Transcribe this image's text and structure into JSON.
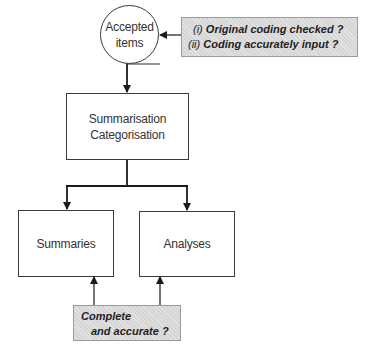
{
  "diagram": {
    "nodes": {
      "accepted": {
        "line1": "Accepted",
        "line2": "items"
      },
      "summarisation": {
        "line1": "Summarisation",
        "line2": "Categorisation"
      },
      "summaries": {
        "label": "Summaries"
      },
      "analyses": {
        "label": "Analyses"
      }
    },
    "notes": {
      "input_check": {
        "items": [
          {
            "marker": "(i)",
            "text": "Original coding checked ?"
          },
          {
            "marker": "(ii)",
            "text": "Coding accurately input ?"
          }
        ]
      },
      "output_check": {
        "line1": "Complete",
        "line2": "and accurate ?"
      }
    },
    "colors": {
      "line": "#2a2a2a",
      "note_fill": "#d6d6d6",
      "node_border": "#3a3a3a"
    }
  }
}
